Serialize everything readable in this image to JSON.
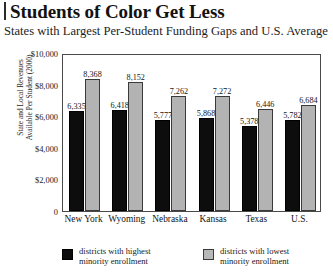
{
  "header": {
    "title": "Students of Color Get Less",
    "subtitle": "States with Largest Per-Student Funding Gaps and U.S. Average"
  },
  "axis": {
    "y_title_line1": "State and Local Revenues",
    "y_title_line2": "Available Per Student (2000)",
    "y_ticks": [
      "$10,000",
      "$8,000",
      "$6,000",
      "$4,000",
      "$2,000",
      "0"
    ]
  },
  "legend": {
    "items": [
      {
        "color": "#0d0d0d",
        "line1": "districts with highest",
        "line2": "minority enrollment"
      },
      {
        "color": "#b8b8b8",
        "line1": "districts with lowest",
        "line2": "minority enrollment"
      }
    ]
  },
  "labels": {
    "v0_0": "6,335",
    "v0_1": "8,368",
    "v1_0": "6,418",
    "v1_1": "8,152",
    "v2_0": "5,777",
    "v2_1": "7,262",
    "v3_0": "5,868",
    "v3_1": "7,272",
    "v4_0": "5,378",
    "v4_1": "6,446",
    "v5_0": "5,782",
    "v5_1": "6,684",
    "c0": "New York",
    "c1": "Wyoming",
    "c2": "Nebraska",
    "c3": "Kansas",
    "c4": "Texas",
    "c5": "U.S."
  },
  "chart_data": {
    "type": "bar",
    "title": "Students of Color Get Less",
    "subtitle": "States with Largest Per-Student Funding Gaps and U.S. Average",
    "xlabel": "",
    "ylabel": "State and Local Revenues Available Per Student (2000)",
    "ylim": [
      0,
      10000
    ],
    "yticks": [
      0,
      2000,
      4000,
      6000,
      8000,
      10000
    ],
    "ytick_labels": [
      "0",
      "$2,000",
      "$4,000",
      "$6,000",
      "$8,000",
      "$10,000"
    ],
    "grid": false,
    "legend_position": "bottom",
    "categories": [
      "New York",
      "Wyoming",
      "Nebraska",
      "Kansas",
      "Texas",
      "U.S."
    ],
    "series": [
      {
        "name": "districts with highest minority enrollment",
        "color": "#0d0d0d",
        "values": [
          6335,
          6418,
          5777,
          5868,
          5378,
          5782
        ],
        "labels": [
          "6,335",
          "6,418",
          "5,777",
          "5,868",
          "5,378",
          "5,782"
        ]
      },
      {
        "name": "districts with lowest minority enrollment",
        "color": "#b3b3b3",
        "values": [
          8368,
          8152,
          7262,
          7272,
          6446,
          6684
        ],
        "labels": [
          "8,368",
          "8,152",
          "7,262",
          "7,272",
          "6,446",
          "6,684"
        ]
      }
    ]
  }
}
